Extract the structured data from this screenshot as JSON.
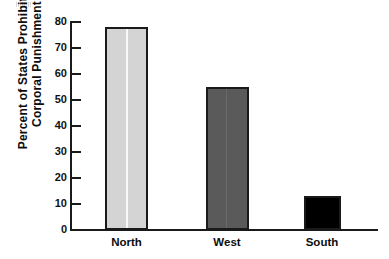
{
  "chart_data": {
    "type": "bar",
    "title": "",
    "subtitle": "",
    "xlabel": "",
    "ylabel": "Percent of States Prohibiting Corporal Punishment",
    "ylabel_lines": [
      "Percent of States Prohibiting",
      "Corporal Punishment"
    ],
    "categories": [
      "North",
      "West",
      "South"
    ],
    "values": [
      78,
      55,
      13
    ],
    "ylim": [
      0,
      80
    ],
    "yticks": [
      0,
      10,
      20,
      30,
      40,
      50,
      60,
      70,
      80
    ],
    "ytick_labels": [
      "0",
      "10",
      "20",
      "30",
      "40",
      "50",
      "60",
      "70",
      "80"
    ],
    "grid": false,
    "legend": false,
    "legend_position": "none",
    "bar_colors": [
      "#d4d4d4",
      "#5a5a5a",
      "#000000"
    ],
    "bar_edge_color": "#1a1a1a",
    "axis_color": "#1a1a1a",
    "background": "#ffffff"
  },
  "axis": {
    "y_title_line1": "Percent of States Prohibiting",
    "y_title_line2": "Corporal Punishment"
  }
}
